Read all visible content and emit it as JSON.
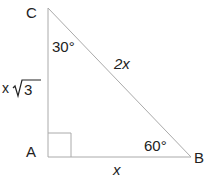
{
  "diagram": {
    "type": "right-triangle",
    "colors": {
      "stroke": "#aaaaaa",
      "text": "#222222",
      "background": "#ffffff"
    },
    "vertices": {
      "A": {
        "label": "A",
        "x": 48,
        "y": 157
      },
      "B": {
        "label": "B",
        "x": 191,
        "y": 157
      },
      "C": {
        "label": "C",
        "x": 48,
        "y": 8
      }
    },
    "angles": {
      "C": {
        "label": "30°"
      },
      "B": {
        "label": "60°"
      },
      "A": {
        "label": "right-angle"
      }
    },
    "sides": {
      "AB": {
        "label": "x"
      },
      "BC": {
        "label": "2x"
      },
      "AC": {
        "label_prefix": "x",
        "label_radical": "3"
      }
    }
  }
}
